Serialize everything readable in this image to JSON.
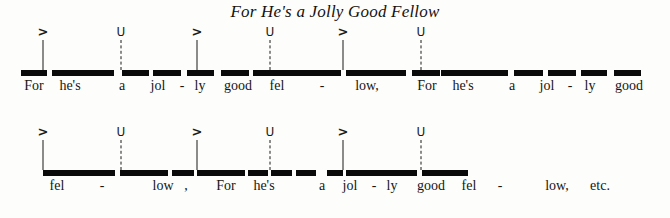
{
  "figure": {
    "title": "For He's a Jolly Good Fellow",
    "accent_symbol": ">",
    "unstressed_symbol": "U",
    "ink_color": "#0a0a0a",
    "background_color": "#fdfdfb"
  },
  "systems": [
    {
      "name": "system-1",
      "top": 26,
      "markers": [
        {
          "symbol": ">",
          "type": "accent",
          "x": 43
        },
        {
          "symbol": "U",
          "type": "unstressed",
          "x": 121
        },
        {
          "symbol": ">",
          "type": "accent",
          "x": 197
        },
        {
          "symbol": "U",
          "type": "unstressed",
          "x": 270
        },
        {
          "symbol": ">",
          "type": "accent",
          "x": 343
        },
        {
          "symbol": "U",
          "type": "unstressed",
          "x": 421
        }
      ],
      "barlines": [
        {
          "x": 43,
          "style": "solid"
        },
        {
          "x": 121,
          "style": "dashed"
        },
        {
          "x": 197,
          "style": "solid"
        },
        {
          "x": 270,
          "style": "dashed"
        },
        {
          "x": 343,
          "style": "solid"
        },
        {
          "x": 421,
          "style": "dashed"
        }
      ],
      "bars": [
        {
          "x": 21,
          "width": 26
        },
        {
          "x": 52,
          "width": 62
        },
        {
          "x": 122,
          "width": 27
        },
        {
          "x": 153,
          "width": 28
        },
        {
          "x": 187,
          "width": 27
        },
        {
          "x": 221,
          "width": 28
        },
        {
          "x": 253,
          "width": 88
        },
        {
          "x": 346,
          "width": 60
        },
        {
          "x": 412,
          "width": 28
        },
        {
          "x": 441,
          "width": 67
        },
        {
          "x": 514,
          "width": 29
        },
        {
          "x": 548,
          "width": 28
        },
        {
          "x": 581,
          "width": 26
        },
        {
          "x": 614,
          "width": 27
        }
      ],
      "lyrics": [
        {
          "text": "For",
          "x": 34
        },
        {
          "text": "he's",
          "x": 70
        },
        {
          "text": "a",
          "x": 122
        },
        {
          "text": "jol",
          "x": 158
        },
        {
          "text": "-",
          "x": 182
        },
        {
          "text": "ly",
          "x": 200
        },
        {
          "text": "good",
          "x": 238
        },
        {
          "text": "fel",
          "x": 277
        },
        {
          "text": "-",
          "x": 322
        },
        {
          "text": "low,",
          "x": 367
        },
        {
          "text": "For",
          "x": 427
        },
        {
          "text": "he's",
          "x": 463
        },
        {
          "text": "a",
          "x": 512
        },
        {
          "text": "jol",
          "x": 547
        },
        {
          "text": "-",
          "x": 570
        },
        {
          "text": "ly",
          "x": 590
        },
        {
          "text": "good",
          "x": 629
        }
      ]
    },
    {
      "name": "system-2",
      "top": 126,
      "markers": [
        {
          "symbol": ">",
          "type": "accent",
          "x": 43
        },
        {
          "symbol": "U",
          "type": "unstressed",
          "x": 121
        },
        {
          "symbol": ">",
          "type": "accent",
          "x": 197
        },
        {
          "symbol": "U",
          "type": "unstressed",
          "x": 270
        },
        {
          "symbol": ">",
          "type": "accent",
          "x": 343
        },
        {
          "symbol": "U",
          "type": "unstressed",
          "x": 421
        }
      ],
      "barlines": [
        {
          "x": 43,
          "style": "solid"
        },
        {
          "x": 121,
          "style": "dashed"
        },
        {
          "x": 197,
          "style": "solid"
        },
        {
          "x": 270,
          "style": "dashed"
        },
        {
          "x": 343,
          "style": "solid"
        },
        {
          "x": 421,
          "style": "dashed"
        }
      ],
      "bars": [
        {
          "x": 43,
          "width": 72
        },
        {
          "x": 120,
          "width": 48
        },
        {
          "x": 172,
          "width": 22
        },
        {
          "x": 197,
          "width": 48
        },
        {
          "x": 248,
          "width": 20
        },
        {
          "x": 271,
          "width": 21
        },
        {
          "x": 296,
          "width": 20
        },
        {
          "x": 327,
          "width": 16
        },
        {
          "x": 346,
          "width": 71
        },
        {
          "x": 422,
          "width": 46
        }
      ],
      "lyrics": [
        {
          "text": "fel",
          "x": 57
        },
        {
          "text": "-",
          "x": 102
        },
        {
          "text": "low",
          "x": 163
        },
        {
          "text": ",",
          "x": 186
        },
        {
          "text": "For",
          "x": 226
        },
        {
          "text": "he's",
          "x": 264
        },
        {
          "text": "a",
          "x": 322
        },
        {
          "text": "jol",
          "x": 350
        },
        {
          "text": "-",
          "x": 374
        },
        {
          "text": "ly",
          "x": 392
        },
        {
          "text": "good",
          "x": 431
        },
        {
          "text": "fel",
          "x": 469
        },
        {
          "text": "-",
          "x": 500
        },
        {
          "text": "low,",
          "x": 557
        },
        {
          "text": "etc.",
          "x": 600
        }
      ]
    }
  ]
}
